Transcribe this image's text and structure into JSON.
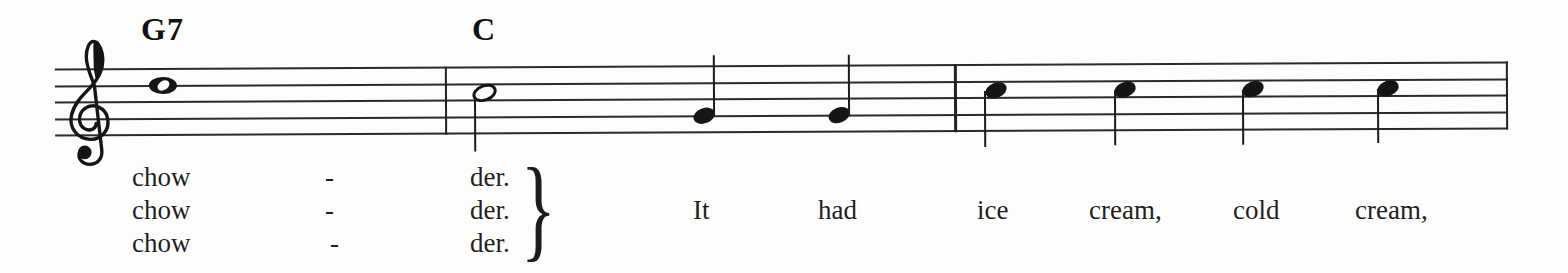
{
  "document_type": "sheet music excerpt",
  "colors": {
    "ink": "#1c1c1c",
    "paper": "#fdfdfc"
  },
  "music": {
    "clef": "treble",
    "chords": [
      {
        "label": "G7"
      },
      {
        "label": "C"
      }
    ],
    "barline_count": 3,
    "notes": [
      {
        "pitch": "D5",
        "duration": "whole",
        "lyric": "chow",
        "chord": "G7"
      },
      {
        "pitch": "C5",
        "duration": "half",
        "lyric": "der.",
        "chord": "C",
        "stem": "down"
      },
      {
        "pitch": "G4",
        "duration": "quarter",
        "lyric": "It",
        "stem": "up"
      },
      {
        "pitch": "G4",
        "duration": "quarter",
        "lyric": "had",
        "stem": "up"
      },
      {
        "pitch": "C5",
        "duration": "quarter",
        "lyric": "ice",
        "stem": "down"
      },
      {
        "pitch": "C5",
        "duration": "quarter",
        "lyric": "cream,",
        "stem": "down"
      },
      {
        "pitch": "C5",
        "duration": "quarter",
        "lyric": "cold",
        "stem": "down"
      },
      {
        "pitch": "C5",
        "duration": "quarter",
        "lyric": "cream,",
        "stem": "down"
      }
    ]
  },
  "lyrics": {
    "verses": [
      {
        "word": "chow",
        "hyphen": "-",
        "syllable": "der."
      },
      {
        "word": "chow",
        "hyphen": "-",
        "syllable": "der."
      },
      {
        "word": "chow",
        "hyphen": "-",
        "syllable": "der."
      }
    ],
    "brace_glyph": "}",
    "line": [
      {
        "word": "It"
      },
      {
        "word": "had"
      },
      {
        "word": "ice"
      },
      {
        "word": "cream,"
      },
      {
        "word": "cold"
      },
      {
        "word": "cream,"
      }
    ]
  }
}
